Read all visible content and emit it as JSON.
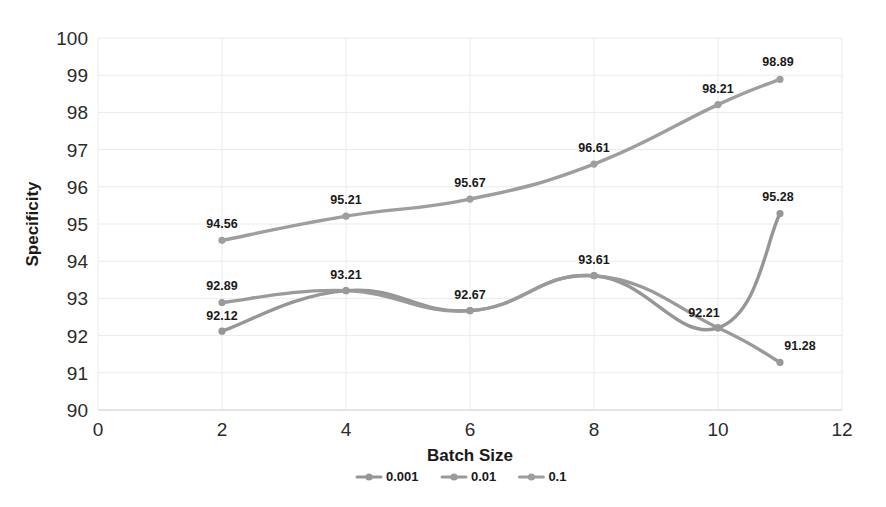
{
  "chart_data": {
    "type": "line",
    "title": "",
    "xlabel": "Batch Size",
    "ylabel": "Specificity",
    "xlim": [
      0,
      12
    ],
    "ylim": [
      90,
      100
    ],
    "xticks": [
      "0",
      "2",
      "4",
      "6",
      "8",
      "10",
      "12"
    ],
    "yticks": [
      "90",
      "91",
      "92",
      "93",
      "94",
      "95",
      "96",
      "97",
      "98",
      "99",
      "100"
    ],
    "grid": true,
    "legend_position": "bottom",
    "x": [
      2,
      4,
      6,
      8,
      10,
      11
    ],
    "series": [
      {
        "name": "0.001",
        "color": "#969696",
        "values": [
          92.12,
          93.21,
          92.67,
          93.61,
          92.21,
          95.28
        ],
        "labels": [
          "92.12",
          "93.21",
          "92.67",
          "93.61",
          "92.21",
          "95.28"
        ]
      },
      {
        "name": "0.01",
        "color": "#9a9a9a",
        "values": [
          92.89,
          93.21,
          92.67,
          93.61,
          92.21,
          91.28
        ],
        "labels": [
          "92.89",
          "",
          "",
          "",
          "",
          "91.28"
        ]
      },
      {
        "name": "0.1",
        "color": "#9e9e9e",
        "values": [
          94.56,
          95.21,
          95.67,
          96.61,
          98.21,
          98.89
        ],
        "labels": [
          "94.56",
          "95.21",
          "95.67",
          "96.61",
          "98.21",
          "98.89"
        ]
      }
    ]
  },
  "legend": {
    "items": [
      {
        "label": "0.001"
      },
      {
        "label": "0.01"
      },
      {
        "label": "0.1"
      }
    ]
  },
  "axes": {
    "x_title": "Batch Size",
    "y_title": "Specificity"
  },
  "colors": {
    "line": "#9a9a9a",
    "grid": "#ebebeb",
    "axis": "#d9d9d9",
    "text": "#1a1a1a",
    "background": "#ffffff"
  }
}
